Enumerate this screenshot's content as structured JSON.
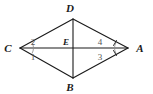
{
  "figure": {
    "background_color": "#ffffff",
    "stroke_color": "#1a1a1a",
    "arc_color": "#8a8a8a",
    "number_color": "#555555",
    "vertices": [
      {
        "name": "C",
        "label": "C",
        "x": 20,
        "y": 48,
        "label_x": 8,
        "label_y": 52
      },
      {
        "name": "D",
        "label": "D",
        "x": 73,
        "y": 19,
        "label_x": 68,
        "label_y": 12
      },
      {
        "name": "A",
        "label": "A",
        "x": 128,
        "y": 48,
        "label_x": 135,
        "label_y": 52
      },
      {
        "name": "B",
        "label": "B",
        "x": 73,
        "y": 78,
        "label_x": 68,
        "label_y": 91
      },
      {
        "name": "E",
        "label": "E",
        "x": 73,
        "y": 48,
        "label_x": 63,
        "label_y": 45
      }
    ],
    "edges": [
      {
        "name": "segment-CD",
        "from": "C",
        "to": "D"
      },
      {
        "name": "segment-DA",
        "from": "D",
        "to": "A"
      },
      {
        "name": "segment-AB",
        "from": "A",
        "to": "B"
      },
      {
        "name": "segment-BC",
        "from": "B",
        "to": "C"
      }
    ],
    "diagonals": [
      {
        "name": "diagonal-CA",
        "from": "C",
        "to": "A"
      },
      {
        "name": "diagonal-DB",
        "from": "D",
        "to": "B"
      }
    ],
    "angle_labels": [
      {
        "name": "angle-2",
        "text": "2",
        "x": 33,
        "y": 45,
        "vertex": "C",
        "position": "upper"
      },
      {
        "name": "angle-1",
        "text": "1",
        "x": 33,
        "y": 59,
        "vertex": "C",
        "position": "lower"
      },
      {
        "name": "angle-4",
        "text": "4",
        "x": 98,
        "y": 45,
        "vertex": "A",
        "position": "upper"
      },
      {
        "name": "angle-3",
        "text": "3",
        "x": 98,
        "y": 59,
        "vertex": "A",
        "position": "lower"
      }
    ],
    "angle_arcs": [
      {
        "name": "arc-angle-2",
        "d": "M 32 42.5 A 13 13 0 0 1 33.5 47.6"
      },
      {
        "name": "arc-angle-1",
        "d": "M 33.5 48.4 A 13 13 0 0 1 32 53.5"
      },
      {
        "name": "arc-angle-4",
        "d": "M 114.5 47.6 A 13 13 0 0 1 116 42.5"
      },
      {
        "name": "arc-angle-3",
        "d": "M 116 53.5 A 13 13 0 0 1 114.5 48.4"
      }
    ],
    "tick_marks": [
      {
        "name": "tick-angle-4",
        "x1": 116.5,
        "y1": 40.5,
        "x2": 113.5,
        "y2": 45.5
      },
      {
        "name": "tick-angle-3",
        "x1": 116.5,
        "y1": 55.5,
        "x2": 113.5,
        "y2": 50.5
      }
    ]
  }
}
